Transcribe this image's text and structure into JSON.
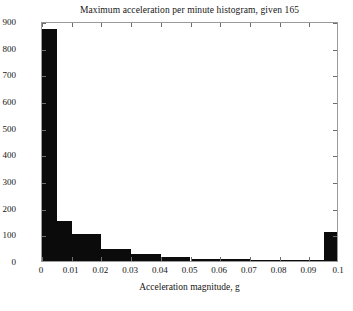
{
  "chart_data": {
    "type": "bar",
    "title": "Maximum acceleration per minute histogram, given 165",
    "xlabel": "Acceleration magnitude, g",
    "ylabel": "",
    "xlim": [
      0,
      0.1
    ],
    "ylim": [
      0,
      900
    ],
    "grid": false,
    "legend": null,
    "bin_width": 0.005,
    "bin_edges": [
      0,
      0.005,
      0.01,
      0.015,
      0.02,
      0.025,
      0.03,
      0.035,
      0.04,
      0.045,
      0.05,
      0.055,
      0.06,
      0.065,
      0.07,
      0.075,
      0.08,
      0.085,
      0.09,
      0.095,
      0.1
    ],
    "categories": [
      "0-0.005",
      "0.005-0.01",
      "0.01-0.015",
      "0.015-0.02",
      "0.02-0.025",
      "0.025-0.03",
      "0.03-0.035",
      "0.035-0.04",
      "0.04-0.045",
      "0.045-0.05",
      "0.05-0.055",
      "0.055-0.06",
      "0.06-0.065",
      "0.065-0.07",
      "0.07-0.075",
      "0.075-0.08",
      "0.08-0.085",
      "0.085-0.09",
      "0.09-0.095",
      "0.095-0.1"
    ],
    "values": [
      870,
      150,
      100,
      100,
      45,
      45,
      28,
      28,
      14,
      14,
      8,
      8,
      6,
      6,
      4,
      4,
      3,
      3,
      4,
      110
    ],
    "xticks": [
      0,
      0.01,
      0.02,
      0.03,
      0.04,
      0.05,
      0.06,
      0.07,
      0.08,
      0.09,
      0.1
    ],
    "xtick_labels": [
      "0",
      "0.01",
      "0.02",
      "0.03",
      "0.04",
      "0.05",
      "0.06",
      "0.07",
      "0.08",
      "0.09",
      "0.1"
    ],
    "yticks": [
      0,
      100,
      200,
      300,
      400,
      500,
      600,
      700,
      800,
      900
    ],
    "ytick_labels": [
      "0",
      "100",
      "200",
      "300",
      "400",
      "500",
      "600",
      "700",
      "800",
      "900"
    ],
    "bar_color": "#0b0b0b",
    "frame_color": "#9a9a9a",
    "background_color": "#ffffff"
  }
}
